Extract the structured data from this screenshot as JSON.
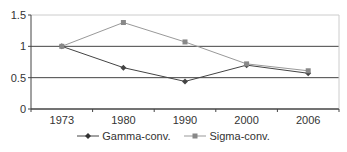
{
  "chart_data": {
    "type": "line",
    "title": "",
    "xlabel": "",
    "ylabel": "",
    "categories": [
      "1973",
      "1980",
      "1990",
      "2000",
      "2006"
    ],
    "series": [
      {
        "name": "Gamma-conv.",
        "values": [
          1.0,
          0.66,
          0.44,
          0.7,
          0.57
        ],
        "marker": "diamond",
        "color": "#444444"
      },
      {
        "name": "Sigma-conv.",
        "values": [
          1.0,
          1.38,
          1.07,
          0.72,
          0.61
        ],
        "marker": "square",
        "color": "#888888"
      }
    ],
    "ylim": [
      0,
      1.5
    ],
    "yticks": [
      "0",
      "0.5",
      "1",
      "1.5"
    ],
    "grid": true,
    "legend_position": "bottom"
  },
  "legend": {
    "gamma_label": "Gamma-conv.",
    "sigma_label": "Sigma-conv."
  }
}
